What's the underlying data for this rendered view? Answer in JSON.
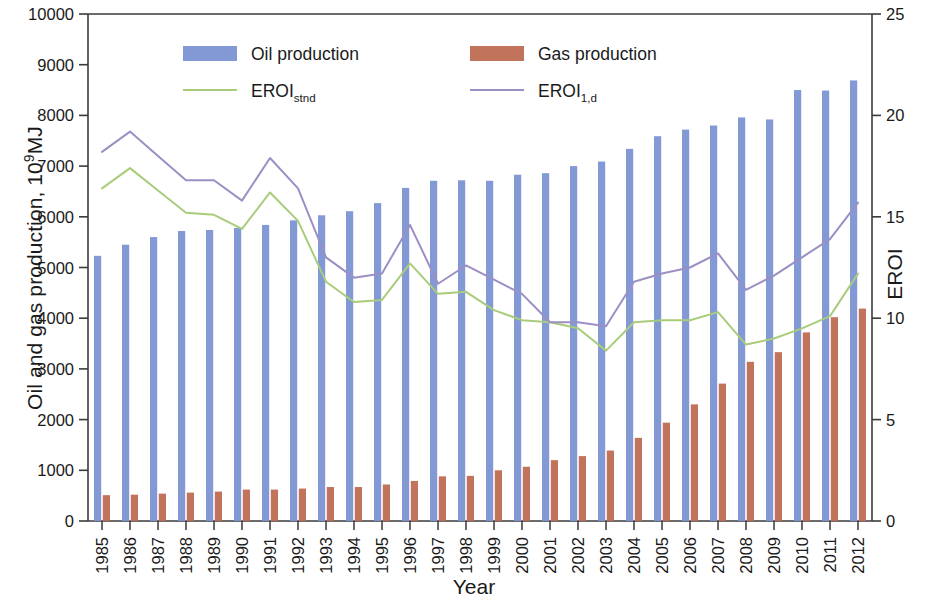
{
  "chart_data": {
    "type": "bar",
    "title": "",
    "xlabel": "Year",
    "ylabel": "Oil and gas production, 10⁹MJ",
    "ylabel_right": "EROI",
    "categories": [
      "1985",
      "1986",
      "1987",
      "1988",
      "1989",
      "1990",
      "1991",
      "1992",
      "1993",
      "1994",
      "1995",
      "1996",
      "1997",
      "1998",
      "1999",
      "2000",
      "2001",
      "2002",
      "2003",
      "2004",
      "2005",
      "2006",
      "2007",
      "2008",
      "2009",
      "2010",
      "2011",
      "2012"
    ],
    "ylim": [
      0,
      10000
    ],
    "yticks": [
      0,
      1000,
      2000,
      3000,
      4000,
      5000,
      6000,
      7000,
      8000,
      9000,
      10000
    ],
    "ylim_right": [
      0,
      25
    ],
    "yticks_right": [
      0,
      5,
      10,
      15,
      20,
      25
    ],
    "grid": false,
    "legend_position": "top-inside",
    "series": [
      {
        "name": "Oil production",
        "type": "bar",
        "axis": "left",
        "color": "#7b93d4",
        "values": [
          5230,
          5450,
          5600,
          5720,
          5740,
          5780,
          5840,
          5930,
          6030,
          6110,
          6270,
          6570,
          6710,
          6720,
          6710,
          6830,
          6860,
          7000,
          7090,
          7340,
          7590,
          7720,
          7800,
          7960,
          7920,
          8500,
          8490,
          8690
        ]
      },
      {
        "name": "Gas production",
        "type": "bar",
        "axis": "left",
        "color": "#bf6b52",
        "values": [
          510,
          520,
          540,
          560,
          580,
          620,
          620,
          640,
          670,
          670,
          720,
          790,
          880,
          890,
          1000,
          1070,
          1200,
          1280,
          1390,
          1640,
          1940,
          2300,
          2710,
          3140,
          3330,
          3720,
          4020,
          4190
        ]
      },
      {
        "name": "EROI_stnd",
        "label": "EROI",
        "label_sub": "stnd",
        "type": "line",
        "axis": "right",
        "color": "#a8cc7a",
        "values": [
          16.4,
          17.4,
          16.3,
          15.2,
          15.1,
          14.4,
          16.2,
          14.8,
          11.8,
          10.8,
          10.9,
          12.7,
          11.2,
          11.3,
          10.4,
          9.9,
          9.8,
          9.5,
          8.4,
          9.8,
          9.9,
          9.9,
          10.3,
          8.7,
          9.0,
          9.5,
          10.1,
          12.2
        ]
      },
      {
        "name": "EROI_1,d",
        "label": "EROI",
        "label_sub": "1,d",
        "type": "line",
        "axis": "right",
        "color": "#9b8fc4",
        "values": [
          18.2,
          19.2,
          18.0,
          16.8,
          16.8,
          15.8,
          17.9,
          16.4,
          13.0,
          12.0,
          12.2,
          14.6,
          11.7,
          12.6,
          11.9,
          11.2,
          9.8,
          9.8,
          9.6,
          11.8,
          12.2,
          12.5,
          13.2,
          11.4,
          12.1,
          13.0,
          13.9,
          15.7
        ]
      }
    ]
  },
  "legend": [
    {
      "key": "oil",
      "label": "Oil production",
      "marker": "bar",
      "color": "#7b93d4"
    },
    {
      "key": "gas",
      "label": "Gas production",
      "marker": "bar",
      "color": "#bf6b52"
    },
    {
      "key": "stnd",
      "label": "EROI",
      "sub": "stnd",
      "marker": "line",
      "color": "#a8cc7a"
    },
    {
      "key": "1d",
      "label": "EROI",
      "sub": "1,d",
      "marker": "line",
      "color": "#9b8fc4"
    }
  ],
  "axes": {
    "y_left_title_main": "Oil and gas production, 10",
    "y_left_title_sup": "9",
    "y_left_title_tail": "MJ",
    "y_right_title": "EROI",
    "x_title": "Year"
  }
}
